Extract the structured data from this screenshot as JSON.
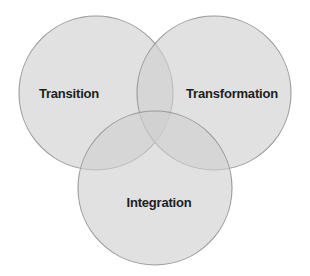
{
  "diagram": {
    "type": "venn",
    "title": "",
    "background_color": "#ffffff",
    "circle_fill_color": "#cfcfcf",
    "circle_stroke_color": "#9a9a9a",
    "label_color": "#1e1e1e",
    "sets": [
      {
        "id": "transition",
        "label": "Transition",
        "position": "left",
        "center_x": 96,
        "center_y": 93,
        "radius": 77,
        "label_x": 69,
        "label_y": 93
      },
      {
        "id": "transformation",
        "label": "Transformation",
        "position": "right",
        "center_x": 214,
        "center_y": 93,
        "radius": 77,
        "label_x": 232,
        "label_y": 93
      },
      {
        "id": "integration",
        "label": "Integration",
        "position": "bottom",
        "center_x": 155,
        "center_y": 188,
        "radius": 77,
        "label_x": 159,
        "label_y": 202
      }
    ]
  }
}
